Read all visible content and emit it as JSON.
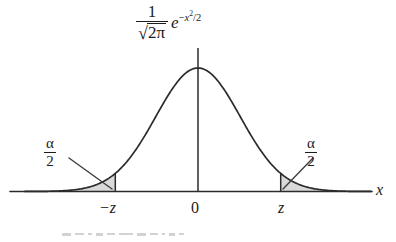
{
  "figure": {
    "title_formula": {
      "numerator": "1",
      "radical_glyph": "√",
      "radicand": "2π",
      "exp_base": "e",
      "exp_minus": "−",
      "exp_var": "x",
      "exp_power": "2",
      "exp_divisor": "/2"
    },
    "alpha_left": {
      "numerator": "α",
      "denominator": "2"
    },
    "alpha_right": {
      "numerator": "α",
      "denominator": "2"
    },
    "axis_label_x": "x",
    "ticks": [
      {
        "name": "negative-z",
        "label": "−z"
      },
      {
        "name": "zero",
        "label": "0"
      },
      {
        "name": "positive-z",
        "label": "z"
      }
    ],
    "colors": {
      "curve": "#2b2b2b",
      "axis": "#2b2b2b",
      "tail_fill": "#d9d9d9",
      "tail_stroke": "#6f6f6f",
      "leader": "#3a3a3a",
      "background": "#ffffff"
    }
  },
  "chart_data": {
    "type": "line",
    "subtitle": "",
    "xlabel": "x",
    "ylabel": "",
    "function": "standard normal probability density",
    "formula": "f(x) = (1/sqrt(2*pi)) * exp(-x^2/2)",
    "xlim": [
      -4.1,
      4.1
    ],
    "ylim": [
      0,
      0.42
    ],
    "grid": false,
    "legend": false,
    "mean": 0,
    "stddev": 1,
    "peak_value": 0.3989,
    "tick_values": [
      -1.96,
      0,
      1.96
    ],
    "tick_labels": [
      "−z",
      "0",
      "z"
    ],
    "critical_value_z": 1.96,
    "shaded_regions": [
      {
        "name": "left-tail",
        "label": "α/2",
        "from": -4.1,
        "to": -1.96,
        "area": 0.025,
        "fill": "#d9d9d9"
      },
      {
        "name": "right-tail",
        "label": "α/2",
        "from": 1.96,
        "to": 4.1,
        "area": 0.025,
        "fill": "#d9d9d9"
      }
    ],
    "annotations": [
      {
        "text": "α/2",
        "target_x": -2.3,
        "side": "left"
      },
      {
        "text": "α/2",
        "target_x": 2.3,
        "side": "right"
      }
    ],
    "vertical_lines": [
      {
        "x": -1.96,
        "from_y": 0,
        "to_y": 0.0584
      },
      {
        "x": 0,
        "from_y": 0,
        "to_y": 0.447
      },
      {
        "x": 1.96,
        "from_y": 0,
        "to_y": 0.0584
      }
    ],
    "x": [
      -4.1,
      -3.8,
      -3.5,
      -3.2,
      -2.9,
      -2.6,
      -2.3,
      -2.0,
      -1.96,
      -1.7,
      -1.4,
      -1.1,
      -0.8,
      -0.5,
      -0.2,
      0.0,
      0.2,
      0.5,
      0.8,
      1.1,
      1.4,
      1.7,
      1.96,
      2.0,
      2.3,
      2.6,
      2.9,
      3.2,
      3.5,
      3.8,
      4.1
    ],
    "y": [
      0.0001,
      0.0003,
      0.0009,
      0.0024,
      0.006,
      0.0136,
      0.0283,
      0.054,
      0.0584,
      0.094,
      0.1497,
      0.2179,
      0.2897,
      0.3521,
      0.391,
      0.3989,
      0.391,
      0.3521,
      0.2897,
      0.2179,
      0.1497,
      0.094,
      0.0584,
      0.054,
      0.0283,
      0.0136,
      0.006,
      0.0024,
      0.0009,
      0.0003,
      0.0001
    ]
  }
}
